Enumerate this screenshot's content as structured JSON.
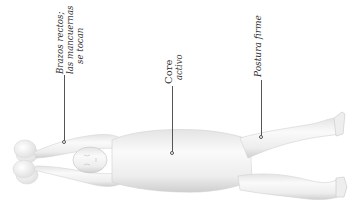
{
  "illustration": {
    "subject": "person lying supine with arms extended overhead holding dumbbells",
    "colors": {
      "background": "#ffffff",
      "body_fill": "#f2f2f2",
      "body_shade": "#d6d6d6",
      "leader_line": "#555555",
      "label_text": "#333333"
    }
  },
  "annotations": [
    {
      "id": "arms",
      "lines": [
        "Brazos rectos;",
        "las mancuernas",
        "se tocan"
      ],
      "style": "italic"
    },
    {
      "id": "core",
      "title": "Core",
      "subtitle": "activo"
    },
    {
      "id": "posture",
      "lines": [
        "Postura firme"
      ],
      "style": "italic"
    }
  ]
}
